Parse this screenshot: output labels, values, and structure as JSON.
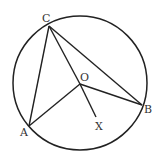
{
  "diagram": {
    "type": "circle-geometry",
    "circle": {
      "cx": 80,
      "cy": 83,
      "r": 67
    },
    "points": {
      "C": {
        "x": 49,
        "y": 26,
        "label": "C",
        "lx": 42,
        "ly": 22
      },
      "O": {
        "x": 80,
        "y": 84,
        "label": "O",
        "lx": 80,
        "ly": 81
      },
      "A": {
        "x": 29,
        "y": 126,
        "label": "A",
        "lx": 20,
        "ly": 136
      },
      "B": {
        "x": 142,
        "y": 105,
        "label": "B",
        "lx": 144,
        "ly": 113
      },
      "X": {
        "x": 96,
        "y": 117,
        "label": "X",
        "lx": 95,
        "ly": 130
      }
    },
    "segments": [
      [
        "C",
        "A"
      ],
      [
        "C",
        "B"
      ],
      [
        "C",
        "O"
      ],
      [
        "O",
        "A"
      ],
      [
        "O",
        "B"
      ],
      [
        "O",
        "X"
      ]
    ],
    "stroke_color": "#222222"
  }
}
